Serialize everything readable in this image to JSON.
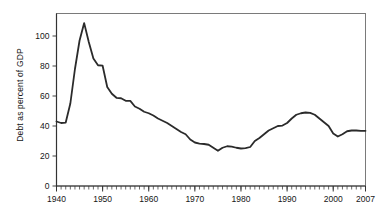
{
  "chart_data": {
    "type": "line",
    "title": "",
    "subtitle": "",
    "xlabel": "",
    "ylabel": "Debt as percent of GDP",
    "xlim": [
      1940,
      2007
    ],
    "ylim": [
      0,
      115
    ],
    "grid": false,
    "legend": null,
    "legend_position": "none",
    "line_color": "#2b2b2b",
    "line_width": 1.8,
    "frame_color": "#6e6e6e",
    "background": "#ffffff",
    "y_ticks": [
      0,
      20,
      40,
      60,
      80,
      100
    ],
    "y_tick_labels": [
      "0",
      "20",
      "40",
      "60",
      "80",
      "100"
    ],
    "x_ticks": [
      1940,
      1950,
      1960,
      1970,
      1980,
      1990,
      2000,
      2007
    ],
    "x_tick_labels": [
      "1940",
      "1950",
      "1960",
      "1970",
      "1980",
      "1990",
      "2000",
      "2007"
    ],
    "x_minor_tick_step": 1,
    "series": [
      {
        "name": "Debt as percent of GDP",
        "x": [
          1940,
          1941,
          1942,
          1943,
          1944,
          1945,
          1946,
          1947,
          1948,
          1949,
          1950,
          1951,
          1952,
          1953,
          1954,
          1955,
          1956,
          1957,
          1958,
          1959,
          1960,
          1961,
          1962,
          1963,
          1964,
          1965,
          1966,
          1967,
          1968,
          1969,
          1970,
          1971,
          1972,
          1973,
          1974,
          1975,
          1976,
          1977,
          1978,
          1979,
          1980,
          1981,
          1982,
          1983,
          1984,
          1985,
          1986,
          1987,
          1988,
          1989,
          1990,
          1991,
          1992,
          1993,
          1994,
          1995,
          1996,
          1997,
          1998,
          1999,
          2000,
          2001,
          2002,
          2003,
          2004,
          2005,
          2006,
          2007
        ],
        "values": [
          43.0,
          42.0,
          42.3,
          55.0,
          78.0,
          97.0,
          108.6,
          96.0,
          85.0,
          80.5,
          80.2,
          66.0,
          61.5,
          58.8,
          58.5,
          56.8,
          56.7,
          53.0,
          51.5,
          49.5,
          48.5,
          47.0,
          45.0,
          43.5,
          42.0,
          40.0,
          38.0,
          36.0,
          34.5,
          31.0,
          29.0,
          28.3,
          28.0,
          27.5,
          25.5,
          23.5,
          25.5,
          26.5,
          26.3,
          25.5,
          25.0,
          25.2,
          26.0,
          30.0,
          32.0,
          34.5,
          37.0,
          38.5,
          40.0,
          40.3,
          42.0,
          45.0,
          47.5,
          48.5,
          49.0,
          48.7,
          47.5,
          45.0,
          42.5,
          40.0,
          35.0,
          33.0,
          34.5,
          36.5,
          37.0,
          37.0,
          36.8,
          36.8
        ]
      }
    ]
  },
  "axes": {
    "y_axis_title": "Debt as percent of GDP"
  }
}
